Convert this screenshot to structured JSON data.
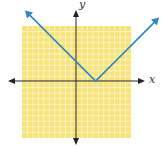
{
  "chart_data": {
    "type": "line",
    "title": "",
    "xlabel": "x",
    "ylabel": "y",
    "function": "y = |x - h|",
    "grid": true,
    "grid_cells": 20,
    "xlim": [
      -10,
      10
    ],
    "ylim": [
      -10,
      10
    ],
    "vertex": [
      3.6,
      0
    ],
    "y_intercept": 3.6,
    "slopes": [
      -1,
      1
    ],
    "series": [
      {
        "name": "absolute-value-graph",
        "x": [
          -10,
          3.6,
          10
        ],
        "y": [
          13.6,
          0,
          6.4
        ]
      }
    ],
    "colors": {
      "grid_fill": "#f7e37a",
      "grid_line": "#fdf6d2",
      "axis": "#222222",
      "line": "#2f86c0"
    }
  },
  "labels": {
    "x_axis": "x",
    "y_axis": "y"
  }
}
